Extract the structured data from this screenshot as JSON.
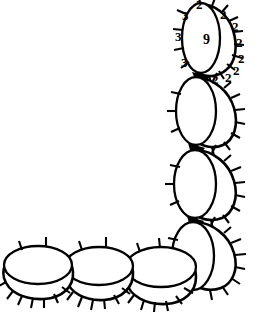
{
  "figure": {
    "background_color": "#ffffff",
    "ink_color": "#000000",
    "width": 257,
    "height": 320
  },
  "annotations": {
    "interior_label": {
      "text": "9",
      "x": 203,
      "y": 33,
      "size": "big"
    },
    "left_labels": [
      {
        "text": "3",
        "x": 182,
        "y": 9
      },
      {
        "text": "3",
        "x": 175,
        "y": 30
      },
      {
        "text": "3",
        "x": 181,
        "y": 56
      }
    ],
    "right_labels": [
      {
        "text": "2",
        "x": 196,
        "y": 0
      },
      {
        "text": "2",
        "x": 220,
        "y": 8
      },
      {
        "text": "2",
        "x": 232,
        "y": 20
      },
      {
        "text": "2",
        "x": 236,
        "y": 36
      },
      {
        "text": "2",
        "x": 238,
        "y": 52
      },
      {
        "text": "2",
        "x": 233,
        "y": 64
      },
      {
        "text": "2",
        "x": 225,
        "y": 71
      },
      {
        "text": "2",
        "x": 212,
        "y": 73
      }
    ]
  },
  "segments": {
    "vertical_chain": [
      {
        "name": "segment-v1",
        "label": "9",
        "ticks": "numbered"
      },
      {
        "name": "segment-v2",
        "label": "",
        "ticks": "plain"
      },
      {
        "name": "segment-v3",
        "label": "",
        "ticks": "plain"
      },
      {
        "name": "segment-v4",
        "label": "",
        "ticks": "plain"
      }
    ],
    "horizontal_chain": [
      {
        "name": "segment-h1",
        "label": "",
        "ticks": "plain"
      },
      {
        "name": "segment-h2",
        "label": "",
        "ticks": "plain"
      },
      {
        "name": "segment-h3",
        "label": "",
        "ticks": "plain"
      }
    ]
  }
}
